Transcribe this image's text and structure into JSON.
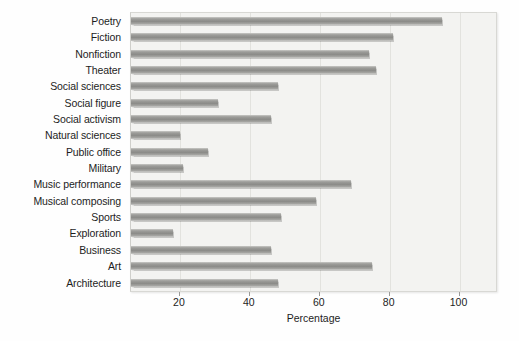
{
  "chart_data": {
    "type": "bar",
    "orientation": "horizontal",
    "title": "",
    "xlabel": "Percentage",
    "ylabel": "",
    "xlim": [
      6,
      111
    ],
    "xticks": [
      20,
      40,
      60,
      80,
      100
    ],
    "grid": "vertical",
    "legend": "none",
    "categories": [
      "Poetry",
      "Fiction",
      "Nonfiction",
      "Theater",
      "Social sciences",
      "Social figure",
      "Social activism",
      "Natural sciences",
      "Public office",
      "Military",
      "Music performance",
      "Musical composing",
      "Sports",
      "Exploration",
      "Business",
      "Art",
      "Architecture"
    ],
    "values": [
      95,
      81,
      74,
      76,
      48,
      31,
      46,
      20,
      28,
      21,
      69,
      59,
      49,
      18,
      46,
      75,
      48
    ],
    "bar_color": "#9a9a97",
    "plot_background": "#f3f3f1"
  }
}
